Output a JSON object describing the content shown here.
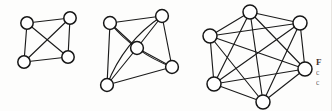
{
  "figure": {
    "background_color": "#fdfdfc",
    "stroke_color": "#1b1b1b",
    "node_fill_color": "#ffffff",
    "node_stroke_color": "#161616"
  },
  "caption": {
    "line_1": "F",
    "line_2": "c",
    "line_3": "c"
  },
  "chart_data": {
    "type": "diagram",
    "xlabel": "",
    "ylabel": "",
    "grid": false,
    "legend": "none",
    "graphs": [
      {
        "name": "K4",
        "label": "complete graph on 4 vertices",
        "node_count": 4,
        "edge_count": 6,
        "node_radius": 6.2,
        "nodes": [
          {
            "id": "a1",
            "x": 27,
            "y": 23
          },
          {
            "id": "a2",
            "x": 70,
            "y": 18
          },
          {
            "id": "a3",
            "x": 24,
            "y": 62
          },
          {
            "id": "a4",
            "x": 68,
            "y": 57
          }
        ],
        "edges": [
          {
            "from": "a1",
            "to": "a2",
            "curve": 0
          },
          {
            "from": "a1",
            "to": "a3",
            "curve": 0
          },
          {
            "from": "a1",
            "to": "a4",
            "curve": 0
          },
          {
            "from": "a2",
            "to": "a3",
            "curve": 0
          },
          {
            "from": "a2",
            "to": "a4",
            "curve": 0
          },
          {
            "from": "a3",
            "to": "a4",
            "curve": 0
          }
        ]
      },
      {
        "name": "K5",
        "label": "complete graph on 5 vertices",
        "node_count": 5,
        "edge_count": 10,
        "node_radius": 6.4,
        "nodes": [
          {
            "id": "b1",
            "x": 110,
            "y": 23
          },
          {
            "id": "b2",
            "x": 162,
            "y": 16
          },
          {
            "id": "b3",
            "x": 137,
            "y": 48
          },
          {
            "id": "b4",
            "x": 172,
            "y": 67
          },
          {
            "id": "b5",
            "x": 107,
            "y": 85
          }
        ],
        "edges": [
          {
            "from": "b1",
            "to": "b2",
            "curve": 0
          },
          {
            "from": "b1",
            "to": "b3",
            "curve": 0
          },
          {
            "from": "b1",
            "to": "b4",
            "curve": 10
          },
          {
            "from": "b1",
            "to": "b5",
            "curve": 0
          },
          {
            "from": "b2",
            "to": "b3",
            "curve": 0
          },
          {
            "from": "b2",
            "to": "b4",
            "curve": 0
          },
          {
            "from": "b2",
            "to": "b5",
            "curve": 14
          },
          {
            "from": "b3",
            "to": "b4",
            "curve": 0
          },
          {
            "from": "b3",
            "to": "b5",
            "curve": 0
          },
          {
            "from": "b4",
            "to": "b5",
            "curve": 0
          }
        ]
      },
      {
        "name": "K6",
        "label": "complete graph on 6 vertices",
        "node_count": 6,
        "edge_count": 15,
        "node_radius": 7.0,
        "nodes": [
          {
            "id": "c1",
            "x": 250,
            "y": 12
          },
          {
            "id": "c2",
            "x": 300,
            "y": 23
          },
          {
            "id": "c3",
            "x": 210,
            "y": 36
          },
          {
            "id": "c4",
            "x": 305,
            "y": 69
          },
          {
            "id": "c5",
            "x": 214,
            "y": 84
          },
          {
            "id": "c6",
            "x": 263,
            "y": 102
          }
        ],
        "edges": [
          {
            "from": "c1",
            "to": "c2",
            "curve": 0
          },
          {
            "from": "c1",
            "to": "c3",
            "curve": 0
          },
          {
            "from": "c1",
            "to": "c4",
            "curve": 0
          },
          {
            "from": "c1",
            "to": "c5",
            "curve": 0
          },
          {
            "from": "c1",
            "to": "c6",
            "curve": 0
          },
          {
            "from": "c2",
            "to": "c3",
            "curve": 0
          },
          {
            "from": "c2",
            "to": "c4",
            "curve": 0
          },
          {
            "from": "c2",
            "to": "c5",
            "curve": 0
          },
          {
            "from": "c2",
            "to": "c6",
            "curve": 0
          },
          {
            "from": "c3",
            "to": "c4",
            "curve": 0
          },
          {
            "from": "c3",
            "to": "c5",
            "curve": 0
          },
          {
            "from": "c3",
            "to": "c6",
            "curve": 0
          },
          {
            "from": "c4",
            "to": "c5",
            "curve": 0
          },
          {
            "from": "c4",
            "to": "c6",
            "curve": 0
          },
          {
            "from": "c5",
            "to": "c6",
            "curve": 0
          }
        ]
      }
    ]
  }
}
